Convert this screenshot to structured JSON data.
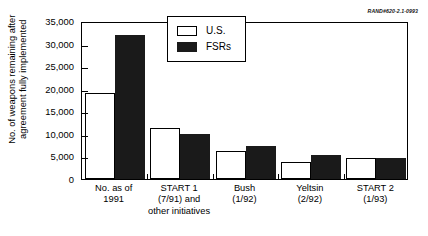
{
  "annotation": {
    "rand_id": "RAND#620-2.1-0993"
  },
  "legend": {
    "position": "inside-top-center",
    "entries": [
      {
        "label": "U.S.",
        "color": "#ffffff",
        "swatch": "hollow-square-icon"
      },
      {
        "label": "FSRs",
        "color": "#1a1a1a",
        "swatch": "filled-square-icon"
      }
    ]
  },
  "axes": {
    "ylabel": "No. of weapons remaining after\nagreement fully implemented",
    "xlabel": "",
    "yticks": [
      0,
      5000,
      10000,
      15000,
      20000,
      25000,
      30000,
      35000
    ],
    "ytick_labels": [
      "0",
      "5,000",
      "10,000",
      "15,000",
      "20,000",
      "25,000",
      "30,000",
      "35,000"
    ],
    "ylim": [
      0,
      35000
    ],
    "grid": false
  },
  "chart_data": {
    "type": "bar",
    "title": "",
    "subtitle": "",
    "xlabel": "",
    "ylabel": "No. of weapons remaining after agreement fully implemented",
    "ylim": [
      0,
      35000
    ],
    "ytick_labels": [
      "0",
      "5,000",
      "10,000",
      "15,000",
      "20,000",
      "25,000",
      "30,000",
      "35,000"
    ],
    "grid": false,
    "legend_position": "inside top center",
    "categories": [
      "No. as of\n1991",
      "START 1\n(7/91) and\nother initiatives",
      "Bush\n(1/92)",
      "Yeltsin\n(2/92)",
      "START 2\n(1/93)"
    ],
    "series": [
      {
        "name": "U.S.",
        "color": "#ffffff",
        "values": [
          19000,
          11200,
          6200,
          3700,
          4700
        ]
      },
      {
        "name": "FSRs",
        "color": "#1a1a1a",
        "values": [
          32000,
          10000,
          7300,
          5300,
          4700
        ]
      }
    ],
    "annotations": [
      "RAND#620-2.1-0993"
    ]
  }
}
